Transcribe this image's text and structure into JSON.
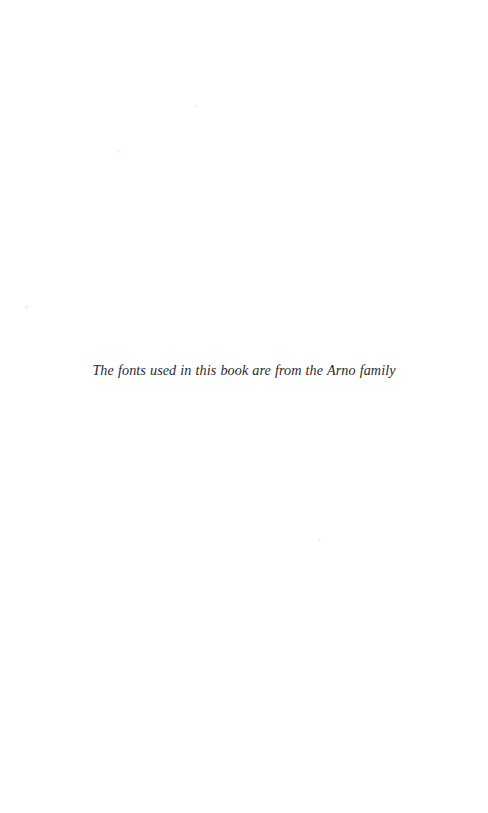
{
  "page": {
    "kind": "book-colophon-page",
    "background_color": "#ffffff",
    "width": 488,
    "height": 813
  },
  "colophon": {
    "text": "The fonts used in this book are from the Arno family",
    "style": "italic",
    "alignment": "center",
    "ink_color": "#2a2a2e"
  }
}
